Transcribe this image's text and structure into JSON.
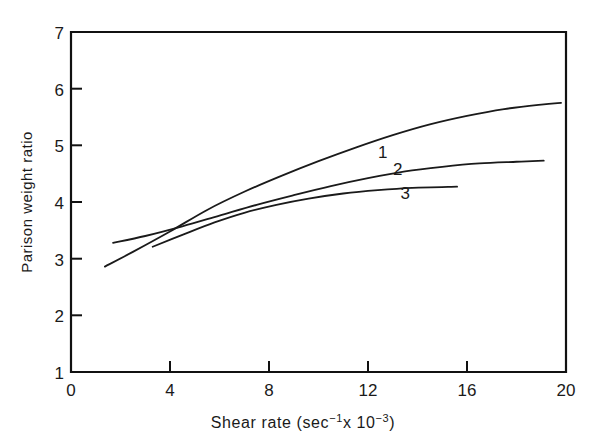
{
  "chart_data": {
    "type": "line",
    "title": "",
    "xlabel": "Shear rate (sec-1x 10-3)",
    "xlabel_parts": {
      "base1": "Shear rate (sec",
      "sup1": "−1",
      "mid": "x 10",
      "sup2": "−3",
      "close": ")"
    },
    "ylabel": "Parison weight ratio",
    "xlim": [
      0,
      20
    ],
    "ylim": [
      1,
      7
    ],
    "xticks": [
      0,
      4,
      8,
      12,
      16,
      20
    ],
    "xtick_labels": [
      "0",
      "4",
      "8",
      "12",
      "16",
      "20"
    ],
    "yticks": [
      1,
      2,
      3,
      4,
      5,
      6,
      7
    ],
    "ytick_labels": [
      "1",
      "2",
      "3",
      "4",
      "5",
      "6",
      "7"
    ],
    "grid": false,
    "legend": "inline-curve-labels",
    "series": [
      {
        "name": "1",
        "label": "1",
        "label_x": 12.6,
        "label_y": 4.78,
        "points": [
          [
            1.37,
            2.86
          ],
          [
            2.5,
            3.12
          ],
          [
            4.0,
            3.48
          ],
          [
            5.5,
            3.86
          ],
          [
            7.0,
            4.18
          ],
          [
            8.5,
            4.46
          ],
          [
            10.0,
            4.72
          ],
          [
            11.5,
            4.96
          ],
          [
            13.0,
            5.18
          ],
          [
            14.5,
            5.37
          ],
          [
            16.0,
            5.52
          ],
          [
            17.5,
            5.64
          ],
          [
            19.0,
            5.72
          ],
          [
            19.8,
            5.75
          ]
        ]
      },
      {
        "name": "2",
        "label": "2",
        "label_x": 13.2,
        "label_y": 4.48,
        "points": [
          [
            1.7,
            3.28
          ],
          [
            3.0,
            3.4
          ],
          [
            4.5,
            3.57
          ],
          [
            6.0,
            3.76
          ],
          [
            7.5,
            3.95
          ],
          [
            9.0,
            4.12
          ],
          [
            10.5,
            4.28
          ],
          [
            12.0,
            4.42
          ],
          [
            13.5,
            4.54
          ],
          [
            15.0,
            4.62
          ],
          [
            16.5,
            4.68
          ],
          [
            18.0,
            4.71
          ],
          [
            19.1,
            4.73
          ]
        ]
      },
      {
        "name": "3",
        "label": "3",
        "label_x": 13.5,
        "label_y": 4.05,
        "points": [
          [
            3.3,
            3.21
          ],
          [
            4.5,
            3.42
          ],
          [
            5.8,
            3.64
          ],
          [
            7.0,
            3.81
          ],
          [
            8.3,
            3.95
          ],
          [
            9.6,
            4.06
          ],
          [
            11.0,
            4.15
          ],
          [
            12.4,
            4.21
          ],
          [
            13.8,
            4.25
          ],
          [
            15.6,
            4.27
          ]
        ]
      }
    ]
  },
  "axes": {
    "left_px": 71,
    "right_px": 566,
    "top_px": 32,
    "bottom_px": 372
  }
}
